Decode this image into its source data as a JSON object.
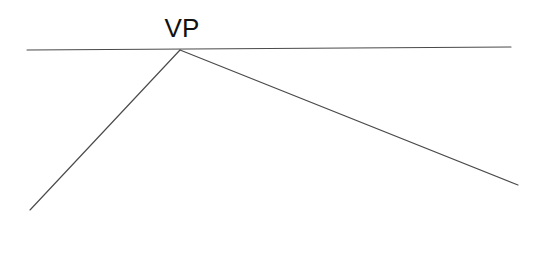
{
  "diagram": {
    "background_color": "#ffffff",
    "line_color": "#4a4a4a",
    "label_color": "#111111",
    "canvas": {
      "width": 534,
      "height": 254
    },
    "labels": {
      "vanishing_point": "VP"
    },
    "points": {
      "vanishing_point": {
        "x": 180,
        "y": 50
      },
      "horizon_left_end": {
        "x": 27,
        "y": 50
      },
      "horizon_right_end": {
        "x": 511,
        "y": 47
      },
      "left_ray_end": {
        "x": 30,
        "y": 210
      },
      "right_ray_end": {
        "x": 518,
        "y": 185
      },
      "vp_label_anchor": {
        "x": 182,
        "y": 37
      }
    },
    "geometry": {
      "horizon_line": "M 27 50 L 511 47",
      "left_ray": "M 180 50 L 30 210",
      "right_ray": "M 180 50 L 518 185"
    }
  }
}
